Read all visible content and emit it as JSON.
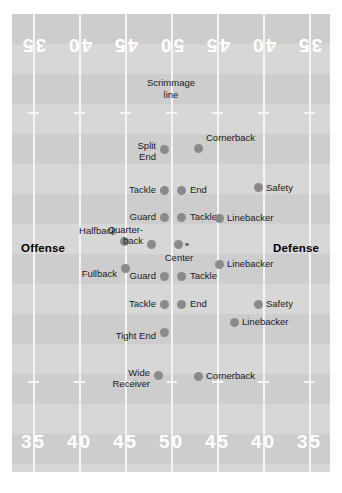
{
  "diagram": {
    "field_color": "#d7d7d7",
    "band_color": "#cdcdcd",
    "line_color": "#f4f4f4",
    "player_color": "#8a8a8a"
  },
  "annotations": {
    "scrimmage": "Scrimmage\nline",
    "scrimmage_line1": "Scrimmage",
    "scrimmage_line2": "line",
    "offense_label": "Offense",
    "defense_label": "Defense"
  },
  "yard_numbers": {
    "top": [
      "35",
      "40",
      "45",
      "50",
      "45",
      "40",
      "35"
    ],
    "bottom": [
      "35",
      "40",
      "45",
      "50",
      "45",
      "40",
      "35"
    ]
  },
  "offense": {
    "players": [
      {
        "name": "Split End",
        "label": "Split\nEnd",
        "l1": "Split",
        "l2": "End"
      },
      {
        "name": "Tackle",
        "label": "Tackle",
        "l1": "Tackle",
        "l2": ""
      },
      {
        "name": "Guard",
        "label": "Guard",
        "l1": "Guard",
        "l2": ""
      },
      {
        "name": "Halfback",
        "label": "Halfback",
        "l1": "Halfback",
        "l2": ""
      },
      {
        "name": "Quarterback",
        "label": "Quarter-\nback",
        "l1": "Quarter-",
        "l2": "back"
      },
      {
        "name": "Center",
        "label": "Center",
        "l1": "Center",
        "l2": ""
      },
      {
        "name": "Fullback",
        "label": "Fullback",
        "l1": "Fullback",
        "l2": ""
      },
      {
        "name": "Guard",
        "label": "Guard",
        "l1": "Guard",
        "l2": ""
      },
      {
        "name": "Tackle",
        "label": "Tackle",
        "l1": "Tackle",
        "l2": ""
      },
      {
        "name": "Tight End",
        "label": "Tight End",
        "l1": "Tight End",
        "l2": ""
      },
      {
        "name": "Wide Receiver",
        "label": "Wide\nReceiver",
        "l1": "Wide",
        "l2": "Receiver"
      }
    ]
  },
  "defense": {
    "players": [
      {
        "name": "Cornerback",
        "label": "Cornerback",
        "l1": "Cornerback",
        "l2": ""
      },
      {
        "name": "End",
        "label": "End",
        "l1": "End",
        "l2": ""
      },
      {
        "name": "Safety",
        "label": "Safety",
        "l1": "Safety",
        "l2": ""
      },
      {
        "name": "Tackle",
        "label": "Tackle",
        "l1": "Tackle",
        "l2": ""
      },
      {
        "name": "Linebacker",
        "label": "Linebacker",
        "l1": "Linebacker",
        "l2": ""
      },
      {
        "name": "Linebacker",
        "label": "Linebacker",
        "l1": "Linebacker",
        "l2": ""
      },
      {
        "name": "Tackle",
        "label": "Tackle",
        "l1": "Tackle",
        "l2": ""
      },
      {
        "name": "End",
        "label": "End",
        "l1": "End",
        "l2": ""
      },
      {
        "name": "Safety",
        "label": "Safety",
        "l1": "Safety",
        "l2": ""
      },
      {
        "name": "Linebacker",
        "label": "Linebacker",
        "l1": "Linebacker",
        "l2": ""
      },
      {
        "name": "Cornerback",
        "label": "Cornerback",
        "l1": "Cornerback",
        "l2": ""
      }
    ]
  }
}
